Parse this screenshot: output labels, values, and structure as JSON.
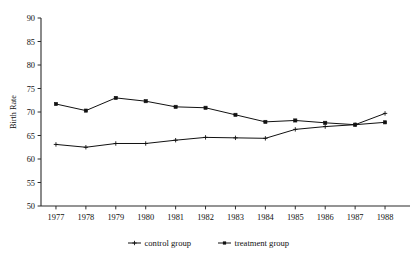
{
  "chart_data": {
    "type": "line",
    "title": "",
    "xlabel": "",
    "ylabel": "Birth Rate",
    "x": [
      1977,
      1978,
      1979,
      1980,
      1981,
      1982,
      1983,
      1984,
      1985,
      1986,
      1987,
      1988
    ],
    "xtick_labels": [
      "1977",
      "1978",
      "1979",
      "1980",
      "1981",
      "1982",
      "1983",
      "1984",
      "1985",
      "1986",
      "1987",
      "1988"
    ],
    "ytick_labels": [
      "50",
      "55",
      "60",
      "65",
      "70",
      "75",
      "80",
      "85",
      "90"
    ],
    "yticks": [
      50,
      55,
      60,
      65,
      70,
      75,
      80,
      85,
      90
    ],
    "ylim": [
      50,
      90
    ],
    "grid": false,
    "legend_position": "bottom-center",
    "series": [
      {
        "name": "control group",
        "marker": "cross",
        "color": "#111111",
        "values": [
          63.1,
          62.5,
          63.3,
          63.3,
          64.0,
          64.6,
          64.5,
          64.4,
          66.3,
          66.9,
          67.3,
          69.7
        ]
      },
      {
        "name": "treatment group",
        "marker": "square",
        "color": "#111111",
        "values": [
          71.7,
          70.3,
          73.0,
          72.3,
          71.1,
          70.9,
          69.4,
          67.9,
          68.2,
          67.7,
          67.3,
          67.8
        ]
      }
    ]
  },
  "legend": {
    "items": [
      {
        "label": "control group"
      },
      {
        "label": "treatment group"
      }
    ]
  },
  "axes": {
    "y_title": "Birth Rate"
  }
}
